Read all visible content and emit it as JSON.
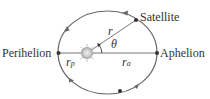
{
  "labels": {
    "satellite": "Satellite",
    "perihelion": "Perihelion",
    "aphelion": "Aphelion",
    "r": "r",
    "theta": "θ",
    "rp_base": "r",
    "rp_sub": "p",
    "ra_base": "r",
    "ra_sub": "a"
  },
  "colors": {
    "orbit": "#666666",
    "text": "#333333",
    "sun": "#bdbdbd"
  }
}
